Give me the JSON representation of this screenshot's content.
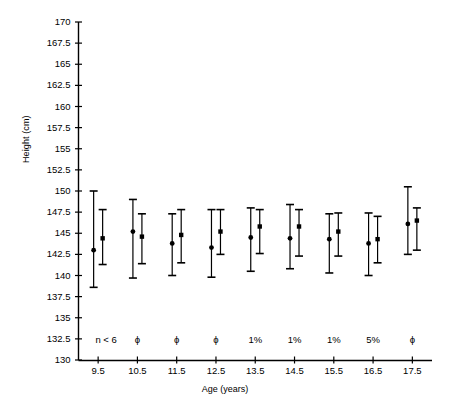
{
  "chart_data": {
    "type": "scatter",
    "title": "",
    "xlabel": "Age (years)",
    "ylabel": "Height (cm)",
    "xlim": [
      9.0,
      18.0
    ],
    "ylim": [
      130,
      170
    ],
    "ytick_step": 2.5,
    "grid": false,
    "legend": "none",
    "categories": [
      "9.5",
      "10.5",
      "11.5",
      "12.5",
      "13.5",
      "14.5",
      "15.5",
      "16.5",
      "17.5"
    ],
    "xticks": [
      "9.5",
      "10.5",
      "11.5",
      "12.5",
      "13.5",
      "14.5",
      "15.5",
      "16.5",
      "17.5"
    ],
    "yticks": [
      "130",
      "132.5",
      "135",
      "137.5",
      "140",
      "142.5",
      "145",
      "147.5",
      "150",
      "152.5",
      "155",
      "157.5",
      "160",
      "162.5",
      "165",
      "167.5",
      "170"
    ],
    "annotations_row_label": "sample-size-note",
    "annotations": [
      "n < 6",
      "ϕ",
      "ϕ",
      "ϕ",
      "1%",
      "1%",
      "1%",
      "5%",
      "ϕ"
    ],
    "series": [
      {
        "name": "group-1",
        "marker": "circle",
        "x": [
          9.5,
          10.5,
          11.5,
          12.5,
          13.5,
          14.5,
          15.5,
          16.5,
          17.5
        ],
        "values": [
          143.0,
          145.2,
          143.8,
          143.3,
          144.5,
          144.4,
          144.3,
          143.8,
          146.1
        ],
        "upper": [
          150.0,
          149.0,
          147.3,
          147.8,
          148.0,
          148.4,
          147.3,
          147.4,
          150.5
        ],
        "lower": [
          138.6,
          139.7,
          140.0,
          139.8,
          140.5,
          140.8,
          140.3,
          140.0,
          142.5
        ]
      },
      {
        "name": "group-2",
        "marker": "square",
        "x": [
          9.5,
          10.5,
          11.5,
          12.5,
          13.5,
          14.5,
          15.5,
          16.5,
          17.5
        ],
        "values": [
          144.4,
          144.6,
          144.8,
          145.2,
          145.8,
          145.8,
          145.2,
          144.3,
          146.5
        ],
        "upper": [
          147.8,
          147.3,
          147.8,
          147.8,
          147.8,
          147.8,
          147.4,
          147.0,
          148.0
        ],
        "lower": [
          141.3,
          141.4,
          141.5,
          142.5,
          142.6,
          142.3,
          142.3,
          141.5,
          143.0
        ]
      }
    ]
  },
  "axes": {
    "y_axis_name": "Height (cm)",
    "x_axis_name": "Age (years)"
  }
}
